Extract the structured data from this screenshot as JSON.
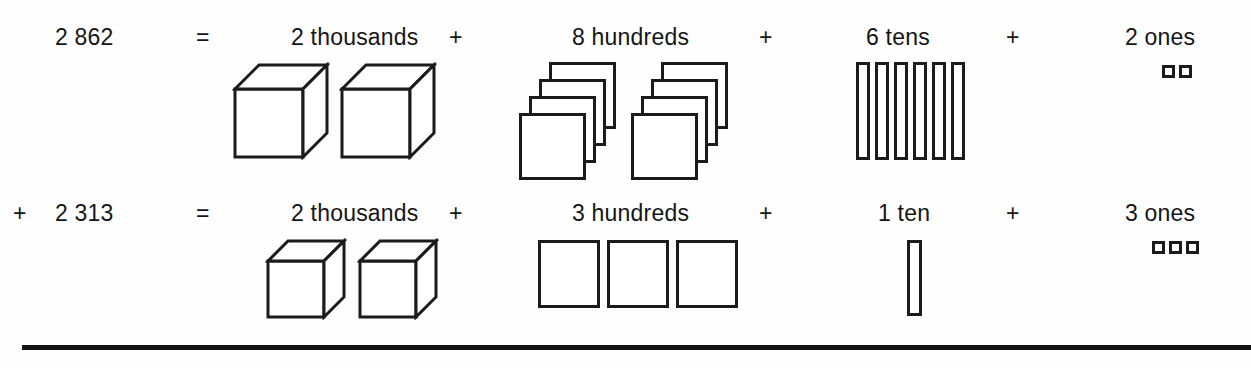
{
  "page": {
    "background_color": "#fefefe",
    "ink_color": "#1b1b1b"
  },
  "rows": [
    {
      "id": "row-1",
      "leading_operator": "",
      "number": "2 862",
      "equals": "=",
      "terms": [
        {
          "id": "thousands",
          "label": "2 thousands",
          "count": 2,
          "unit": "thousand",
          "glyph": "cube"
        },
        {
          "id": "hundreds",
          "label": "8 hundreds",
          "count": 8,
          "unit": "hundred",
          "glyph": "flat-stack",
          "stacks": 2,
          "per_stack": 4
        },
        {
          "id": "tens",
          "label": "6 tens",
          "count": 6,
          "unit": "ten",
          "glyph": "rod"
        },
        {
          "id": "ones",
          "label": "2 ones",
          "count": 2,
          "unit": "one",
          "glyph": "unit"
        }
      ],
      "separators": [
        "+",
        "+",
        "+"
      ]
    },
    {
      "id": "row-2",
      "leading_operator": "+",
      "number": "2 313",
      "equals": "=",
      "terms": [
        {
          "id": "thousands",
          "label": "2 thousands",
          "count": 2,
          "unit": "thousand",
          "glyph": "cube"
        },
        {
          "id": "hundreds",
          "label": "3 hundreds",
          "count": 3,
          "unit": "hundred",
          "glyph": "flat"
        },
        {
          "id": "tens",
          "label": "1 ten",
          "count": 1,
          "unit": "ten",
          "glyph": "rod"
        },
        {
          "id": "ones",
          "label": "3 ones",
          "count": 3,
          "unit": "one",
          "glyph": "unit"
        }
      ],
      "separators": [
        "+",
        "+",
        "+"
      ]
    }
  ],
  "rule": {
    "present": true,
    "label": "sum-rule-line"
  }
}
